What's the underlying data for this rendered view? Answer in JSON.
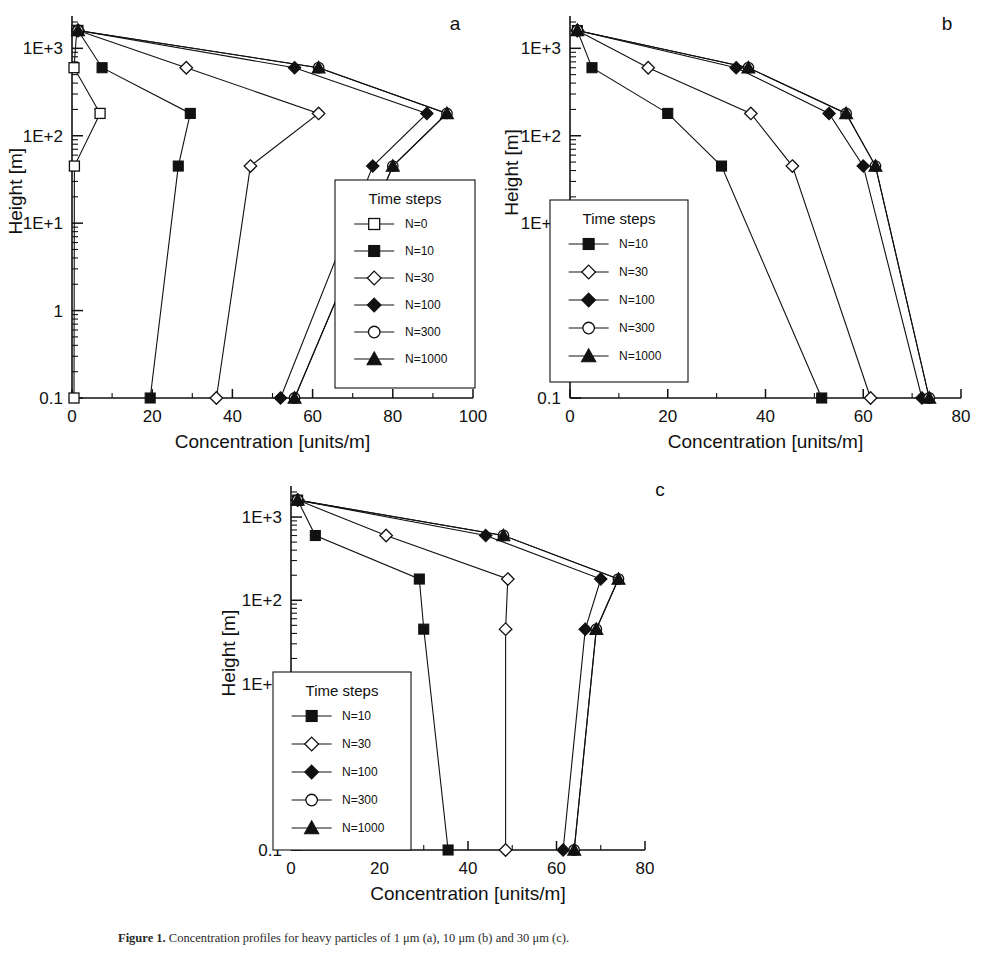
{
  "figure": {
    "caption_label": "Figure 1.",
    "caption_text": "Concentration profiles for heavy particles of 1 μm (a), 10 μm (b) and 30 μm (c)."
  },
  "panels": [
    {
      "id": "a",
      "label": "a",
      "xlabel": "Concentration [units/m]",
      "ylabel": "Height [m]",
      "xticks": [
        0,
        20,
        40,
        60,
        80,
        100
      ],
      "yticklabels": [
        "1E+3",
        "1E+2",
        "1E+1",
        "1",
        "0.1"
      ],
      "legend_title": "Time steps",
      "legend": [
        "N=0",
        "N=10",
        "N=30",
        "N=100",
        "N=300",
        "N=1000"
      ]
    },
    {
      "id": "b",
      "label": "b",
      "xlabel": "Concentration [units/m]",
      "ylabel": "Height [m]",
      "xticks": [
        0,
        20,
        40,
        60,
        80
      ],
      "yticklabels": [
        "1E+3",
        "1E+2",
        "1E+1",
        "1",
        "0.1"
      ],
      "legend_title": "Time steps",
      "legend": [
        "N=10",
        "N=30",
        "N=100",
        "N=300",
        "N=1000"
      ]
    },
    {
      "id": "c",
      "label": "c",
      "xlabel": "Concentration [units/m]",
      "ylabel": "Height [m]",
      "xticks": [
        0,
        20,
        40,
        60,
        80
      ],
      "yticklabels": [
        "1E+3",
        "1E+2",
        "1E+1",
        "1",
        "0.1"
      ],
      "legend_title": "Time steps",
      "legend": [
        "N=10",
        "N=30",
        "N=100",
        "N=300",
        "N=1000"
      ]
    }
  ],
  "chart_data": [
    {
      "type": "line",
      "panel": "a",
      "title": "a",
      "xlabel": "Concentration [units/m]",
      "ylabel": "Height [m]",
      "xlim": [
        0,
        100
      ],
      "ylim": [
        0.1,
        2000
      ],
      "yscale": "log",
      "xticks": [
        0,
        20,
        40,
        60,
        80,
        100
      ],
      "yticks": [
        1000,
        100,
        10,
        1,
        0.1
      ],
      "yticklabels": [
        "1E+3",
        "1E+2",
        "1E+1",
        "1",
        "0.1"
      ],
      "grid": false,
      "legend_title": "Time steps",
      "legend_position": "lower-right",
      "series": [
        {
          "name": "N=0",
          "marker": "open-square",
          "heights": [
            1600,
            600,
            180,
            45,
            0.1
          ],
          "values": [
            1.2,
            0.5,
            7.0,
            0.6,
            0.5
          ]
        },
        {
          "name": "N=10",
          "marker": "filled-square",
          "heights": [
            1600,
            600,
            180,
            45,
            0.1
          ],
          "values": [
            1.5,
            7.5,
            29.5,
            26.5,
            19.5
          ]
        },
        {
          "name": "N=30",
          "marker": "open-diamond",
          "heights": [
            1600,
            600,
            180,
            45,
            0.1
          ],
          "values": [
            1.5,
            28.5,
            61.5,
            44.5,
            36.0
          ]
        },
        {
          "name": "N=100",
          "marker": "filled-diamond",
          "heights": [
            1600,
            600,
            180,
            45,
            0.1
          ],
          "values": [
            1.5,
            55.5,
            88.5,
            75.0,
            52.0
          ]
        },
        {
          "name": "N=300",
          "marker": "open-circle",
          "heights": [
            1600,
            600,
            180,
            45,
            0.1
          ],
          "values": [
            1.5,
            61.5,
            93.5,
            80.0,
            55.5
          ]
        },
        {
          "name": "N=1000",
          "marker": "filled-triangle",
          "heights": [
            1600,
            600,
            180,
            45,
            0.1
          ],
          "values": [
            1.5,
            61.5,
            93.5,
            80.0,
            55.5
          ]
        }
      ]
    },
    {
      "type": "line",
      "panel": "b",
      "title": "b",
      "xlabel": "Concentration [units/m]",
      "ylabel": "Height [m]",
      "xlim": [
        0,
        80
      ],
      "ylim": [
        0.1,
        2000
      ],
      "yscale": "log",
      "xticks": [
        0,
        20,
        40,
        60,
        80
      ],
      "yticks": [
        1000,
        100,
        10,
        1,
        0.1
      ],
      "yticklabels": [
        "1E+3",
        "1E+2",
        "1E+1",
        "1",
        "0.1"
      ],
      "grid": false,
      "legend_title": "Time steps",
      "legend_position": "lower-left",
      "series": [
        {
          "name": "N=10",
          "marker": "filled-square",
          "heights": [
            1600,
            600,
            180,
            45,
            0.1
          ],
          "values": [
            1.5,
            4.5,
            20.0,
            31.0,
            51.5
          ]
        },
        {
          "name": "N=30",
          "marker": "open-diamond",
          "heights": [
            1600,
            600,
            180,
            45,
            0.1
          ],
          "values": [
            1.5,
            16.0,
            37.0,
            45.5,
            61.5
          ]
        },
        {
          "name": "N=100",
          "marker": "filled-diamond",
          "heights": [
            1600,
            600,
            180,
            45,
            0.1
          ],
          "values": [
            1.5,
            34.0,
            53.0,
            60.0,
            72.0
          ]
        },
        {
          "name": "N=300",
          "marker": "open-circle",
          "heights": [
            1600,
            600,
            180,
            45,
            0.1
          ],
          "values": [
            1.5,
            36.5,
            56.5,
            62.5,
            73.5
          ]
        },
        {
          "name": "N=1000",
          "marker": "filled-triangle",
          "heights": [
            1600,
            600,
            180,
            45,
            0.1
          ],
          "values": [
            1.5,
            36.5,
            56.5,
            62.5,
            73.5
          ]
        }
      ]
    },
    {
      "type": "line",
      "panel": "c",
      "title": "c",
      "xlabel": "Concentration [units/m]",
      "ylabel": "Height [m]",
      "xlim": [
        0,
        80
      ],
      "ylim": [
        0.1,
        2000
      ],
      "yscale": "log",
      "xticks": [
        0,
        20,
        40,
        60,
        80
      ],
      "yticks": [
        1000,
        100,
        10,
        1,
        0.1
      ],
      "yticklabels": [
        "1E+3",
        "1E+2",
        "1E+1",
        "1",
        "0.1"
      ],
      "grid": false,
      "legend_title": "Time steps",
      "legend_position": "lower-left",
      "series": [
        {
          "name": "N=10",
          "marker": "filled-square",
          "heights": [
            1600,
            600,
            180,
            45,
            0.1
          ],
          "values": [
            1.5,
            5.5,
            29.0,
            30.0,
            35.5
          ]
        },
        {
          "name": "N=30",
          "marker": "open-diamond",
          "heights": [
            1600,
            600,
            180,
            45,
            0.1
          ],
          "values": [
            1.5,
            21.5,
            49.0,
            48.5,
            48.5
          ]
        },
        {
          "name": "N=100",
          "marker": "filled-diamond",
          "heights": [
            1600,
            600,
            180,
            45,
            0.1
          ],
          "values": [
            1.5,
            44.0,
            70.0,
            66.5,
            61.5
          ]
        },
        {
          "name": "N=300",
          "marker": "open-circle",
          "heights": [
            1600,
            600,
            180,
            45,
            0.1
          ],
          "values": [
            1.5,
            48.0,
            74.0,
            69.0,
            64.0
          ]
        },
        {
          "name": "N=1000",
          "marker": "filled-triangle",
          "heights": [
            1600,
            600,
            180,
            45,
            0.1
          ],
          "values": [
            1.5,
            48.0,
            74.0,
            69.0,
            64.0
          ]
        }
      ]
    }
  ]
}
